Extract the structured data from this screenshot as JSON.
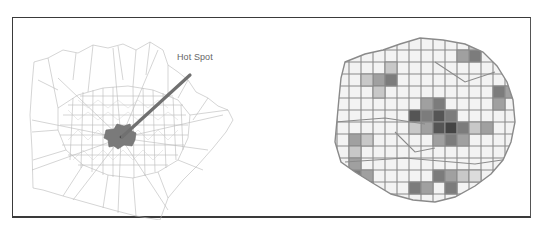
{
  "figure": {
    "left_map": {
      "annotation_label": "Hot Spot",
      "hot_spot_color": "#7a7a7a",
      "boundary_color": "#b5b5b5",
      "arrow_color": "#707070"
    },
    "right_map": {
      "cell_outline_color": "#8a8a8a",
      "shade_levels": [
        "#f4f4f4",
        "#c8c8c8",
        "#a0a0a0",
        "#7c7c7c",
        "#555555"
      ]
    },
    "frame_border_color": "#3a3a3a"
  }
}
